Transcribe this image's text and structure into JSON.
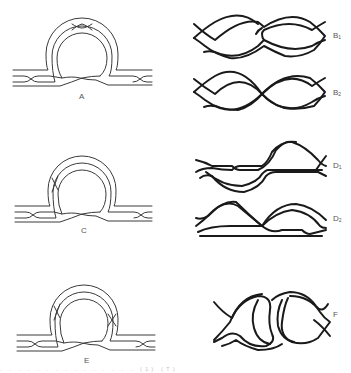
{
  "figure": {
    "panels": [
      {
        "id": "A",
        "label": "A",
        "kind": "loop-with-three-strands",
        "crossings": "left-bundle, loop-top, loop-bottom, right-bundle"
      },
      {
        "id": "B1",
        "label": "B",
        "subscript": "1",
        "kind": "two-lobed-braid"
      },
      {
        "id": "B2",
        "label": "B",
        "subscript": "2",
        "kind": "two-lobed-braid"
      },
      {
        "id": "C",
        "label": "C",
        "kind": "loop-with-three-strands",
        "crossings": "left-bundle, loop-left, loop-bottom, right-bundle"
      },
      {
        "id": "D1",
        "label": "D",
        "subscript": "1",
        "kind": "two-lobed-braid-asymmetric"
      },
      {
        "id": "D2",
        "label": "D",
        "subscript": "2",
        "kind": "two-lobed-braid-asymmetric"
      },
      {
        "id": "E",
        "label": "E",
        "kind": "loop-with-three-strands",
        "crossings": "left-bundle, loop-left, loop-right, loop-bottom, right-bundle"
      },
      {
        "id": "F",
        "label": "F",
        "kind": "interlocked-lobes"
      }
    ],
    "caption_fragment": ". . .  .  .  .  .  .  .  .  .  .  .  .  . (1) (T)",
    "colors": {
      "background": "#ffffff",
      "line": "#1a1a1a",
      "label": "#555555"
    }
  }
}
